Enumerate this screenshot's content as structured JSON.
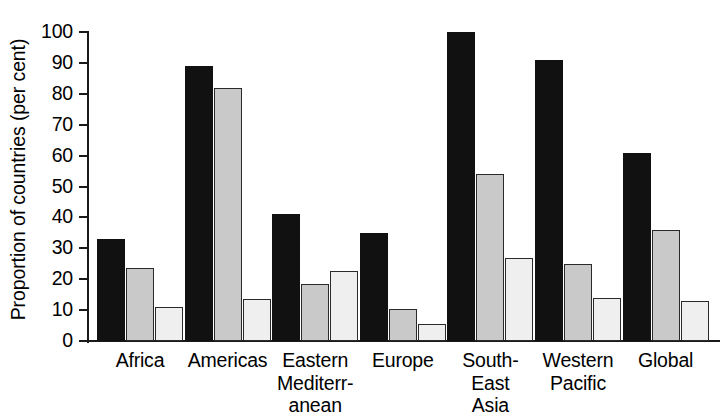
{
  "chart_data": {
    "type": "bar",
    "title": "",
    "xlabel": "",
    "ylabel": "Proportion of countries (per cent)",
    "ylim": [
      0,
      100
    ],
    "ytick_step": 10,
    "grid": false,
    "legend": "none",
    "categories": [
      "Africa",
      "Americas",
      "Eastern Mediterranean",
      "Europe",
      "South-East Asia",
      "Western Pacific",
      "Global"
    ],
    "category_label_lines": [
      [
        "Africa"
      ],
      [
        "Americas"
      ],
      [
        "Eastern",
        "Mediterr-",
        "anean"
      ],
      [
        "Europe"
      ],
      [
        "South-",
        "East",
        "Asia"
      ],
      [
        "Western",
        "Pacific"
      ],
      [
        "Global"
      ]
    ],
    "yticks": [
      "0",
      "10",
      "20",
      "30",
      "40",
      "50",
      "60",
      "70",
      "80",
      "90",
      "100"
    ],
    "series": [
      {
        "name": "series-1",
        "fill": "#111111",
        "values": [
          33,
          89,
          41,
          35,
          100,
          91,
          61
        ]
      },
      {
        "name": "series-2",
        "fill": "#c9c9c9",
        "values": [
          23.5,
          82,
          18.5,
          10.5,
          54,
          25,
          36
        ]
      },
      {
        "name": "series-3",
        "fill": "#efefef",
        "values": [
          11,
          13.5,
          22.5,
          5.5,
          27,
          14,
          13
        ]
      }
    ]
  },
  "colors": {
    "axis": "#1a1a1a",
    "background": "#ffffff",
    "series_dark": "#111111",
    "series_medium": "#c9c9c9",
    "series_light": "#efefef"
  }
}
